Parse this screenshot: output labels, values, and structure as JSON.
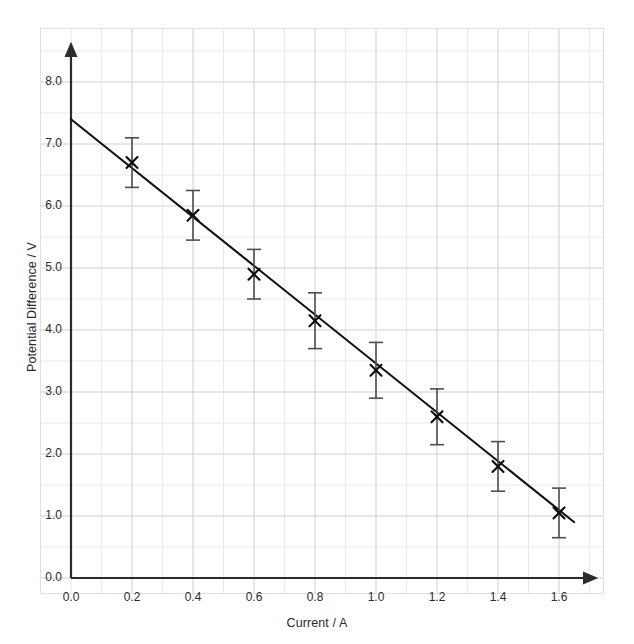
{
  "chart_data": {
    "type": "scatter",
    "title": "",
    "xlabel": "Current / A",
    "ylabel": "Potential Difference / V",
    "xlim": [
      0.0,
      1.8
    ],
    "ylim": [
      0.0,
      8.4
    ],
    "xticks": [
      "0.0",
      "0.2",
      "0.4",
      "0.6",
      "0.8",
      "1.0",
      "1.2",
      "1.4",
      "1.6"
    ],
    "xtick_values": [
      0.0,
      0.2,
      0.4,
      0.6,
      0.8,
      1.0,
      1.2,
      1.4,
      1.6
    ],
    "yticks": [
      "0.0",
      "1.0",
      "2.0",
      "3.0",
      "4.0",
      "5.0",
      "6.0",
      "7.0",
      "8.0"
    ],
    "ytick_values": [
      0.0,
      1.0,
      2.0,
      3.0,
      4.0,
      5.0,
      6.0,
      7.0,
      8.0
    ],
    "grid": true,
    "grid_minor_step_x": 0.1,
    "grid_minor_step_y": 0.5,
    "legend": "none",
    "marker": "x-cross",
    "error_bars": "vertical",
    "x": [
      0.2,
      0.4,
      0.6,
      0.8,
      1.0,
      1.2,
      1.4,
      1.6
    ],
    "values": [
      6.7,
      5.85,
      4.9,
      4.15,
      3.35,
      2.6,
      1.8,
      1.05
    ],
    "yerr": [
      0.4,
      0.4,
      0.4,
      0.45,
      0.45,
      0.45,
      0.4,
      0.4
    ],
    "series": [
      {
        "name": "Potential Difference",
        "x": [
          0.2,
          0.4,
          0.6,
          0.8,
          1.0,
          1.2,
          1.4,
          1.6
        ],
        "values": [
          6.7,
          5.85,
          4.9,
          4.15,
          3.35,
          2.6,
          1.8,
          1.05
        ],
        "yerr": [
          0.4,
          0.4,
          0.4,
          0.45,
          0.45,
          0.45,
          0.4,
          0.4
        ]
      }
    ],
    "fit_line": {
      "name": "best-fit line",
      "x_start": 0.0,
      "y_start": 7.4,
      "x_end": 1.65,
      "y_end": 0.9
    },
    "colors": {
      "axis": "#2b2b2b",
      "data": "#111111",
      "error_bar": "#555555",
      "grid_major": "#c8c8c8",
      "grid_minor": "#e8e8e8",
      "background": "#ffffff"
    }
  }
}
